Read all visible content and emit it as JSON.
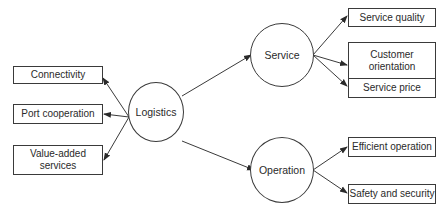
{
  "diagram": {
    "center": {
      "label": "Logistics"
    },
    "left_nodes": [
      {
        "label": "Connectivity"
      },
      {
        "label": "Port cooperation"
      },
      {
        "label": "Value-added services"
      }
    ],
    "hubs": [
      {
        "label": "Service",
        "children": [
          {
            "label": "Service quality"
          },
          {
            "label": "Customer orientation"
          },
          {
            "label": "Service price"
          }
        ]
      },
      {
        "label": "Operation",
        "children": [
          {
            "label": "Efficient operation"
          },
          {
            "label": "Safety and security"
          }
        ]
      }
    ],
    "colors": {
      "stroke": "#3a3a3a",
      "text": "#2a2a2a",
      "background": "#ffffff"
    }
  }
}
